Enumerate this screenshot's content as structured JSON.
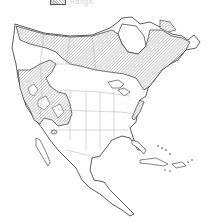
{
  "legend": {
    "items": [
      {
        "label": "Range",
        "pattern": "diagonal-hatch"
      }
    ]
  },
  "map": {
    "region": "North America",
    "features": [
      "Alaska",
      "Canada",
      "Greenland (partial)",
      "United States",
      "Mexico",
      "Central America",
      "Caribbean islands"
    ],
    "range_areas": [
      "Alaska and northern Canada (boreal band)",
      "Western mountains (Rockies, Cascades, Sierra Nevada)",
      "Great Lakes region and New England / Maritimes",
      "Southern Appalachians (isolated patch)",
      "Small isolated patch in Arizona/New Mexico"
    ],
    "colors": {
      "range_fill": "#bdbdbd",
      "outline": "#333333",
      "border": "#888888",
      "background": "#ffffff"
    }
  }
}
